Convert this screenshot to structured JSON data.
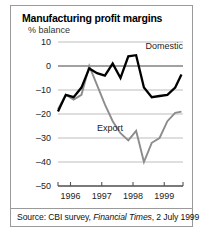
{
  "chart_data": {
    "type": "line",
    "title": "Manufacturing profit margins",
    "subtitle": "% balance",
    "ylabel": "% balance",
    "xlabel": "",
    "ylim": [
      -50,
      10
    ],
    "yticks": [
      10,
      0,
      -10,
      -20,
      -30,
      -40,
      -50
    ],
    "ytick_labels": [
      "10",
      "0",
      "–10",
      "–20",
      "–30",
      "–40",
      "–50"
    ],
    "xlim": [
      1995.6,
      1999.6
    ],
    "xticks": [
      1996,
      1997,
      1998,
      1999
    ],
    "xtick_labels": [
      "1996",
      "1997",
      "1998",
      "1999"
    ],
    "grid": true,
    "legend": "inline-annotations",
    "x": [
      1995.6,
      1995.85,
      1996.1,
      1996.35,
      1996.6,
      1996.85,
      1997.1,
      1997.35,
      1997.6,
      1997.85,
      1998.1,
      1998.35,
      1998.6,
      1998.85,
      1999.1,
      1999.35,
      1999.55
    ],
    "series": [
      {
        "name": "Domestic",
        "color": "#000000",
        "values": [
          -19,
          -12,
          -13,
          -9,
          -1,
          -3,
          -4,
          1,
          -5,
          4,
          4.5,
          -9,
          -13,
          -12.5,
          -12,
          -9,
          -3.5
        ]
      },
      {
        "name": "Export",
        "color": "#8c8c8c",
        "values": [
          -18,
          -12,
          -14,
          -12,
          0,
          -8,
          -16,
          -23,
          -28,
          -31,
          -27,
          -40,
          -32,
          -30,
          -23,
          -19.5,
          -19
        ]
      }
    ],
    "annotations": [
      {
        "text": "Domestic",
        "x": 1999.0,
        "y": 7
      },
      {
        "text": "Export",
        "x": 1996.85,
        "y": -27
      }
    ]
  },
  "source": {
    "prefix": "Source: CBI survey, ",
    "italic": "Financial Times",
    "suffix": ", 2 July 1999",
    "full": "Source: CBI survey, Financial Times, 2 July 1999"
  }
}
